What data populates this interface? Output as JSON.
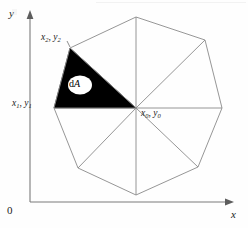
{
  "figure": {
    "axes": {
      "y_label": "y",
      "x_label": "x",
      "origin_label": "0"
    },
    "labels": {
      "vertex0": {
        "x_var": "x",
        "x_sub": "0",
        "y_var": "y",
        "y_sub": "0",
        "separator": ", "
      },
      "vertex1": {
        "x_var": "x",
        "x_sub": "1",
        "y_var": "y",
        "y_sub": "1",
        "separator": ", "
      },
      "vertex2": {
        "x_var": "x",
        "x_sub": "2",
        "y_var": "y",
        "y_sub": "2",
        "separator": ", "
      },
      "area_element": {
        "d": "d",
        "a": "A"
      }
    },
    "colors": {
      "shaded_sector": "#000000",
      "polygon_edge": "#8a8a8a",
      "axis": "#7a7a7a",
      "background": "#fefefe",
      "text": "#1b1b1b"
    }
  },
  "geometry": {
    "center": {
      "x": 136,
      "y": 108
    },
    "polygon_vertices": [
      {
        "x": 136,
        "y": 17
      },
      {
        "x": 205,
        "y": 40
      },
      {
        "x": 222,
        "y": 108
      },
      {
        "x": 198,
        "y": 167
      },
      {
        "x": 136,
        "y": 195
      },
      {
        "x": 78,
        "y": 168
      },
      {
        "x": 54,
        "y": 108
      },
      {
        "x": 70,
        "y": 48
      }
    ],
    "shaded_triangle": [
      {
        "x": 136,
        "y": 108
      },
      {
        "x": 54,
        "y": 108
      },
      {
        "x": 70,
        "y": 48
      }
    ],
    "axis_y": {
      "x": 30,
      "y_top": 14,
      "y_bottom": 202
    },
    "axis_x": {
      "y": 202,
      "x_left": 30,
      "x_right": 234
    }
  }
}
